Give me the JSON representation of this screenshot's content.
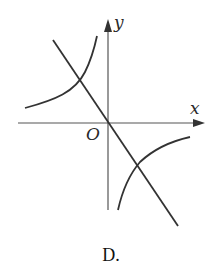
{
  "figure": {
    "option_label": "D.",
    "axes": {
      "x_label": "x",
      "y_label": "y",
      "origin_label": "O"
    },
    "curves": [
      {
        "name": "line",
        "description": "straight line through origin, negative slope"
      },
      {
        "name": "hyperbola-branch-upper-left",
        "description": "branch in quadrant II"
      },
      {
        "name": "hyperbola-branch-lower-right",
        "description": "branch in quadrant IV"
      }
    ],
    "colors": {
      "stroke": "#333333",
      "axis": "#555555"
    }
  }
}
